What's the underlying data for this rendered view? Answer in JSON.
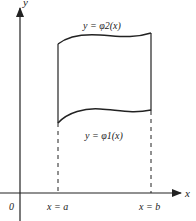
{
  "diagram": {
    "axes": {
      "x_label": "x",
      "y_label": "y",
      "origin_label": "0"
    },
    "curves": {
      "upper": "y = φ2(x)",
      "lower": "y = φ1(x)"
    },
    "bounds": {
      "left": "x = a",
      "right": "x = b"
    },
    "colors": {
      "line": "#222222",
      "background": "#ffffff"
    }
  }
}
